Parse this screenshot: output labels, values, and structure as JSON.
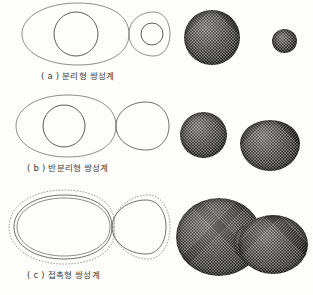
{
  "figure": {
    "background_color": "#fdfdfc",
    "line_color": "#6e6e6e",
    "star_color": "#3c3b3a"
  },
  "panels": [
    {
      "id": "a",
      "label": "( a )",
      "caption": "( a ) 분리형 쌍성계",
      "caption_text": "분리형 쌍성계",
      "type": "detached",
      "roche": {
        "description": "figure-eight Roche lobes, both stars well inside their lobes",
        "primary_lobe_filled": false,
        "secondary_lobe_filled": false,
        "dashed_envelope": false
      },
      "stars": [
        {
          "name": "primary",
          "shape": "sphere",
          "relative_size": "large"
        },
        {
          "name": "secondary",
          "shape": "sphere",
          "relative_size": "small"
        }
      ]
    },
    {
      "id": "b",
      "label": "( b )",
      "caption": "( b ) 반분리형 쌍성계",
      "caption_text": "반분리형 쌍성계",
      "type": "semi-detached",
      "roche": {
        "description": "right component fills its Roche lobe, left component remains inside",
        "primary_lobe_filled": false,
        "secondary_lobe_filled": true,
        "dashed_envelope": false
      },
      "stars": [
        {
          "name": "primary",
          "shape": "sphere",
          "relative_size": "medium"
        },
        {
          "name": "secondary",
          "shape": "teardrop",
          "relative_size": "large"
        }
      ]
    },
    {
      "id": "c",
      "label": "( c )",
      "caption": "( c ) 접촉형 쌍성계",
      "caption_text": "접촉형 쌍성계",
      "type": "contact",
      "roche": {
        "description": "both components overfill their Roche lobes, common dashed envelope surrounds the pair",
        "primary_lobe_filled": true,
        "secondary_lobe_filled": true,
        "dashed_envelope": true
      },
      "stars": [
        {
          "name": "merged-envelope",
          "shape": "dumbbell",
          "relative_size": "large"
        }
      ]
    }
  ]
}
